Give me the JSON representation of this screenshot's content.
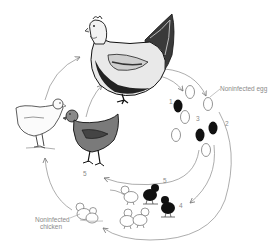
{
  "diagram": {
    "type": "life-cycle",
    "colors": {
      "background": "#ffffff",
      "ink": "#222222",
      "arrow": "#7a7a7a",
      "label": "#8a8a8a",
      "infected": "#111111",
      "noninfected_fill": "#ffffff"
    },
    "labels": {
      "noninfected_egg": "Noninfected egg",
      "noninfected_chicken_line1": "Noninfected",
      "noninfected_chicken_line2": "chicken"
    },
    "steps": [
      {
        "id": "step-1",
        "label": "1"
      },
      {
        "id": "step-2",
        "label": "2"
      },
      {
        "id": "step-3",
        "label": "3"
      },
      {
        "id": "step-4",
        "label": "4"
      },
      {
        "id": "step-5a",
        "label": "5"
      },
      {
        "id": "step-5b",
        "label": "5"
      }
    ],
    "nodes": [
      {
        "id": "adult-hen",
        "name": "Adult hen (infected carrier)"
      },
      {
        "id": "white-pullet",
        "name": "Noninfected pullet"
      },
      {
        "id": "dark-pullet",
        "name": "Infected pullet"
      },
      {
        "id": "eggs",
        "name": "Eggs (infected = black, noninfected = white)"
      },
      {
        "id": "infected-chicks",
        "name": "Infected chicks (black)"
      },
      {
        "id": "noninfected-chicks",
        "name": "Noninfected chicks (white)"
      }
    ],
    "eggs": {
      "infected_count": 3,
      "noninfected_count": 5
    },
    "chicks": {
      "infected_count": 2,
      "noninfected_count": 4
    }
  }
}
